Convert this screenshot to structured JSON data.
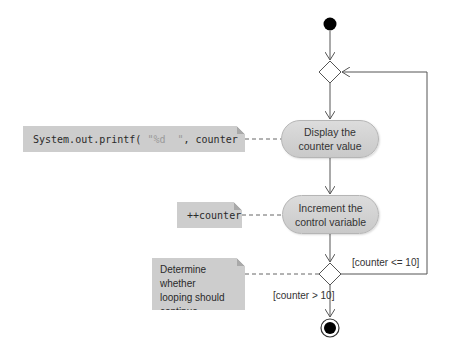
{
  "diagram": {
    "type": "UML activity diagram",
    "nodes": {
      "display": {
        "line1": "Display the",
        "line2": "counter value"
      },
      "increment": {
        "line1": "Increment the",
        "line2": "control variable"
      }
    },
    "notes": {
      "print_code": {
        "prefix": "System.out.printf( ",
        "string_literal": "\"%d  \"",
        "suffix": ", counter );"
      },
      "increment_code": "++counter",
      "decision": {
        "line1": "Determine whether",
        "line2": "looping should",
        "line3": "continue"
      }
    },
    "guards": {
      "loop": "[counter <= 10]",
      "exit": "[counter > 10]"
    },
    "colors": {
      "node_fill": "#d3d3d3",
      "note_fill": "#cdcdcd",
      "line": "#555555",
      "initial": "#000000"
    }
  }
}
